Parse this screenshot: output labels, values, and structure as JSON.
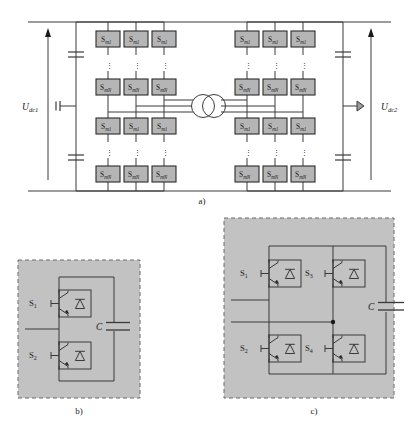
{
  "figure": {
    "background_color": "#ffffff",
    "line_color": "#3a3a3a",
    "module_fill": "#b5b5b5",
    "module_stroke": "#2b2b2b",
    "panel_fill": "#c2c2c2",
    "panel_dash_stroke": "#6b6b6b"
  },
  "panel_a": {
    "caption": "a)",
    "left_bus": {
      "voltage_label_main": "U",
      "voltage_label_sub": "dc1",
      "arrow_direction": "up"
    },
    "right_bus": {
      "voltage_label_main": "U",
      "voltage_label_sub": "dc2",
      "arrow_direction": "up"
    },
    "module_label_top_main": "S",
    "module_label_top_sub": "m1",
    "module_label_bottom_main": "S",
    "module_label_bottom_sub": "mN",
    "vertical_ellipsis": "⋮",
    "left_stack": {
      "columns": 3,
      "arms": 4,
      "top_row_labels": [
        "Sm1",
        "Sm1",
        "Sm1"
      ],
      "second_row_labels": [
        "SmN",
        "SmN",
        "SmN"
      ],
      "third_row_labels": [
        "Sm1",
        "Sm1",
        "Sm1"
      ],
      "bottom_row_labels": [
        "SmN",
        "SmN",
        "SmN"
      ]
    },
    "right_stack": {
      "columns": 3,
      "arms": 4,
      "top_row_labels": [
        "Sm1",
        "Sm1",
        "Sm1"
      ],
      "second_row_labels": [
        "SmN",
        "SmN",
        "SmN"
      ],
      "third_row_labels": [
        "Sm1",
        "Sm1",
        "Sm1"
      ],
      "bottom_row_labels": [
        "SmN",
        "SmN",
        "SmN"
      ]
    },
    "transformer": {
      "type": "three-phase-two-winding",
      "phase_lines": 3,
      "symbol": "two-overlapping-circles"
    },
    "dc_capacitors_per_side": 2
  },
  "panel_b": {
    "caption": "b)",
    "type": "half-bridge-submodule",
    "switches": [
      {
        "label_main": "S",
        "label_sub": "1"
      },
      {
        "label_main": "S",
        "label_sub": "2"
      }
    ],
    "capacitor_label": "C"
  },
  "panel_c": {
    "caption": "c)",
    "type": "full-bridge-submodule",
    "switches": [
      {
        "label_main": "S",
        "label_sub": "1"
      },
      {
        "label_main": "S",
        "label_sub": "3"
      },
      {
        "label_main": "S",
        "label_sub": "2"
      },
      {
        "label_main": "S",
        "label_sub": "4"
      }
    ],
    "capacitor_label": "C"
  }
}
